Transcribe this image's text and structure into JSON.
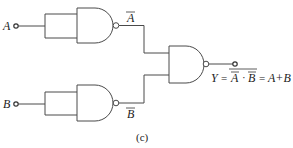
{
  "diagram": {
    "type": "logic-circuit",
    "inputs": [
      {
        "name": "A",
        "label": "A"
      },
      {
        "name": "B",
        "label": "B"
      }
    ],
    "gates": [
      {
        "id": "g1",
        "type": "NAND",
        "inputs_tied": true,
        "input": "A",
        "output_label": "A",
        "output_overbar": true
      },
      {
        "id": "g2",
        "type": "NAND",
        "inputs_tied": true,
        "input": "B",
        "output_label": "B",
        "output_overbar": true
      },
      {
        "id": "g3",
        "type": "NAND",
        "inputs": [
          "g1",
          "g2"
        ],
        "output": "Y"
      }
    ],
    "output": {
      "y_label": "Y",
      "equals": "=",
      "term_a": "A",
      "dot": "·",
      "term_b": "B",
      "equals2": "=",
      "result": "A+B"
    },
    "caption": "(c)",
    "colors": {
      "line": "#4a4a4a",
      "text": "#222222",
      "background": "#ffffff"
    }
  }
}
